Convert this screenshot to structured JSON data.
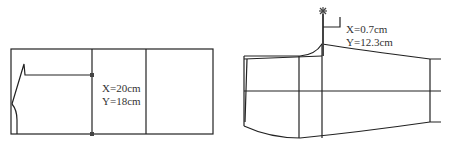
{
  "left_figure": {
    "name": "pattern-draft-rectangle",
    "label_x": "X=20cm",
    "label_y": "Y=18cm"
  },
  "right_figure": {
    "name": "pattern-draft-shaped",
    "label_x": "X=0.7cm",
    "label_y": "Y=12.3cm",
    "marker_icon": "asterisk-marker"
  },
  "colors": {
    "line": "#222222",
    "marker": "#444444",
    "background": "#ffffff"
  }
}
